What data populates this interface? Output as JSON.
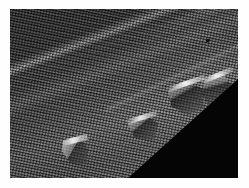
{
  "image": {
    "kind": "electron-micrograph",
    "color_mode": "grayscale",
    "width_px": 249,
    "height_px": 188,
    "border": {
      "present": true,
      "color": "#fefefe",
      "left_px": 10,
      "top_px": 9,
      "right_px": 11,
      "bottom_px": 10
    },
    "plate": {
      "width_px": 228,
      "height_px": 169,
      "background_color": "#3a3a3a"
    },
    "caption": "",
    "scale_bar": {
      "present": false,
      "label": ""
    },
    "annotations": [],
    "overlay_text": []
  },
  "scene": {
    "subject": "micro-textured honeycomb mesh surface viewed at an oblique angle",
    "description": "Oblique view of a finely woven / honeycomb micro-textured sheet. A bright illuminated ridge runs diagonally from lower-left to upper-right, separating a dark shadowed upper facet from a brighter lower facet. Several angular flake-like step defects sit along the ridge. The lower-right corner is empty black background beyond the edge of the specimen.",
    "regions": [
      {
        "name": "upper-facet",
        "label": "Shadowed upper facet",
        "tone": "dark",
        "hex": "#2e2e2e",
        "texture": "fine honeycomb weave"
      },
      {
        "name": "ridge-edge",
        "label": "Illuminated ridge edge",
        "tone": "bright",
        "hex": "#c8c8c8",
        "angle_deg": -21.5
      },
      {
        "name": "lower-facet",
        "label": "Lit lower facet",
        "tone": "mid",
        "hex": "#6a6a6a",
        "texture": "fine honeycomb weave"
      },
      {
        "name": "void",
        "label": "Black background beyond specimen edge",
        "tone": "black",
        "hex": "#050505"
      }
    ],
    "features": [
      {
        "name": "flake-a",
        "label": "Angular step flake (lower left)",
        "x_px": 52,
        "y_px": 128,
        "w_px": 26,
        "h_px": 28
      },
      {
        "name": "flake-b",
        "label": "Angular step flake (center)",
        "x_px": 118,
        "y_px": 106,
        "w_px": 30,
        "h_px": 26
      },
      {
        "name": "flake-c",
        "label": "Angular step flake (right)",
        "x_px": 158,
        "y_px": 72,
        "w_px": 36,
        "h_px": 34
      },
      {
        "name": "flake-d",
        "label": "Angular step flake (far right)",
        "x_px": 192,
        "y_px": 64,
        "w_px": 30,
        "h_px": 40
      },
      {
        "name": "speck",
        "label": "Dark particulate speck",
        "x_px": 196,
        "y_px": 30,
        "w_px": 4,
        "h_px": 3
      }
    ],
    "texture": {
      "pattern": "honeycomb-weave",
      "period_px": 2.7,
      "primary_angle_deg": 12,
      "secondary_angle_deg": 102
    },
    "palette": {
      "darkest": "#050505",
      "shadow": "#2b2b2b",
      "midtone": "#5e5e5e",
      "highlight": "#c8c8c8",
      "brightest": "#f2f2f2",
      "mat": "#fefefe"
    }
  }
}
